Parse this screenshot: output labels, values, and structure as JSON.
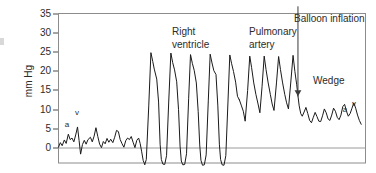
{
  "chart_data": {
    "type": "line",
    "title": "",
    "xlabel": "",
    "ylabel": "mm Hg",
    "ylim": [
      -5,
      36
    ],
    "xlim": [
      0,
      100
    ],
    "grid": false,
    "legend_position": "none",
    "y_ticks": [
      0,
      5,
      10,
      15,
      20,
      25,
      30,
      35
    ],
    "y_tick_labels": [
      "0",
      "5",
      "10",
      "15",
      "20",
      "25",
      "30",
      "35"
    ],
    "zero_reference_line": 0,
    "annotations": [
      {
        "id": "right-ventricle",
        "text": "Right ventricle",
        "lines": [
          "Right",
          "ventricle"
        ],
        "x": 36.5,
        "y": 34.5
      },
      {
        "id": "pulmonary-artery",
        "text": "Pulmonary artery",
        "lines": [
          "Pulmonary",
          "artery"
        ],
        "x": 62.0,
        "y": 34.5
      },
      {
        "id": "balloon-inflation",
        "text": "Balloon inflation",
        "lines": [
          "Balloon inflation"
        ],
        "x": 77.5,
        "y": 40.0
      },
      {
        "id": "wedge",
        "text": "Wedge",
        "lines": [
          "Wedge"
        ],
        "x": 81.5,
        "y": 18.0
      },
      {
        "id": "ra-a-wave",
        "text": "a",
        "x": 2.9,
        "y": 7.0
      },
      {
        "id": "ra-v-wave",
        "text": "v",
        "x": 6.4,
        "y": 10.5
      },
      {
        "id": "pcwp-a-wave",
        "text": "a",
        "x": 93.2,
        "y": 15.0
      },
      {
        "id": "pcwp-v-wave",
        "text": "v",
        "x": 96.3,
        "y": 17.0
      }
    ],
    "arrow": {
      "id": "balloon-inflation-arrow",
      "x": 78.0,
      "y_start": 37.0,
      "y_end": 13.5
    },
    "series": [
      {
        "name": "Pressure tracing",
        "color": "#1a1a1a",
        "segments": [
          {
            "name": "right-atrium",
            "points": [
              [
                0.0,
                0.2
              ],
              [
                0.6,
                1.4
              ],
              [
                1.2,
                0.6
              ],
              [
                1.9,
                2.1
              ],
              [
                2.5,
                1.2
              ],
              [
                3.2,
                3.6
              ],
              [
                3.8,
                2.2
              ],
              [
                4.4,
                2.6
              ],
              [
                5.0,
                1.6
              ],
              [
                5.6,
                3.4
              ],
              [
                6.2,
                5.5
              ],
              [
                6.7,
                2.0
              ],
              [
                7.2,
                -1.6
              ],
              [
                7.8,
                0.9
              ],
              [
                8.4,
                2.0
              ],
              [
                9.0,
                1.0
              ],
              [
                9.6,
                2.2
              ],
              [
                10.4,
                2.8
              ],
              [
                11.0,
                1.6
              ],
              [
                11.6,
                3.1
              ],
              [
                12.2,
                5.3
              ],
              [
                12.8,
                3.0
              ],
              [
                13.4,
                1.0
              ],
              [
                14.0,
                0.1
              ],
              [
                14.6,
                1.7
              ],
              [
                15.2,
                1.1
              ],
              [
                15.8,
                2.5
              ],
              [
                16.4,
                1.5
              ],
              [
                17.0,
                2.3
              ],
              [
                17.7,
                1.4
              ],
              [
                18.3,
                2.8
              ],
              [
                18.9,
                4.6
              ],
              [
                19.5,
                4.3
              ],
              [
                20.1,
                2.2
              ],
              [
                20.7,
                1.1
              ],
              [
                21.3,
                0.2
              ],
              [
                21.9,
                1.9
              ],
              [
                22.5,
                2.6
              ],
              [
                23.1,
                2.2
              ],
              [
                23.7,
                3.0
              ],
              [
                24.3,
                1.5
              ],
              [
                24.9,
                0.1
              ],
              [
                25.5,
                2.0
              ],
              [
                26.1,
                2.6
              ],
              [
                26.6,
                1.2
              ],
              [
                27.1,
                -1.0
              ],
              [
                27.6,
                -3.3
              ],
              [
                28.1,
                -4.3
              ]
            ]
          },
          {
            "name": "right-ventricle",
            "points": [
              [
                28.1,
                -4.3
              ],
              [
                28.6,
                -3.0
              ],
              [
                29.4,
                11.0
              ],
              [
                30.1,
                24.9
              ],
              [
                30.7,
                22.6
              ],
              [
                31.2,
                20.6
              ],
              [
                32.0,
                18.0
              ],
              [
                32.6,
                12.0
              ],
              [
                33.1,
                1.0
              ],
              [
                33.5,
                -3.0
              ],
              [
                34.0,
                -4.2
              ],
              [
                34.6,
                -4.3
              ],
              [
                35.2,
                -2.0
              ],
              [
                35.9,
                12.0
              ],
              [
                36.6,
                24.8
              ],
              [
                37.2,
                22.3
              ],
              [
                37.8,
                20.4
              ],
              [
                38.5,
                17.3
              ],
              [
                39.1,
                10.0
              ],
              [
                39.6,
                0.5
              ],
              [
                40.0,
                -3.4
              ],
              [
                40.5,
                -4.4
              ],
              [
                41.1,
                -4.3
              ],
              [
                41.7,
                -1.5
              ],
              [
                42.4,
                13.0
              ],
              [
                43.0,
                24.4
              ],
              [
                43.6,
                22.1
              ],
              [
                44.2,
                20.3
              ],
              [
                44.9,
                17.0
              ],
              [
                45.5,
                9.5
              ],
              [
                46.0,
                0.8
              ],
              [
                46.4,
                -3.2
              ],
              [
                46.9,
                -4.5
              ],
              [
                47.5,
                -4.4
              ],
              [
                48.1,
                -1.8
              ],
              [
                48.8,
                12.5
              ],
              [
                49.4,
                24.5
              ],
              [
                50.0,
                22.2
              ],
              [
                50.6,
                20.2
              ],
              [
                51.3,
                19.2
              ],
              [
                51.9,
                11.0
              ],
              [
                52.4,
                1.0
              ],
              [
                52.8,
                -3.0
              ],
              [
                53.3,
                -4.4
              ],
              [
                53.9,
                -4.5
              ],
              [
                54.5,
                -2.0
              ],
              [
                55.2,
                12.0
              ],
              [
                55.8,
                24.3
              ],
              [
                56.4,
                22.0
              ],
              [
                57.0,
                20.0
              ],
              [
                57.7,
                17.2
              ],
              [
                58.3,
                13.5
              ],
              [
                58.9,
                12.6
              ]
            ]
          },
          {
            "name": "pulmonary-artery",
            "points": [
              [
                58.9,
                12.6
              ],
              [
                59.6,
                11.0
              ],
              [
                60.2,
                9.6
              ],
              [
                60.8,
                7.0
              ],
              [
                61.6,
                15.0
              ],
              [
                62.3,
                24.0
              ],
              [
                62.9,
                21.0
              ],
              [
                63.6,
                17.0
              ],
              [
                64.3,
                14.0
              ],
              [
                65.0,
                11.5
              ],
              [
                65.6,
                9.2
              ],
              [
                66.3,
                16.0
              ],
              [
                67.0,
                24.0
              ],
              [
                67.6,
                20.5
              ],
              [
                68.3,
                17.0
              ],
              [
                69.0,
                14.0
              ],
              [
                69.6,
                11.5
              ],
              [
                70.2,
                9.8
              ],
              [
                71.0,
                17.0
              ],
              [
                71.7,
                23.9
              ],
              [
                72.3,
                20.5
              ],
              [
                73.0,
                17.0
              ],
              [
                73.7,
                14.0
              ],
              [
                74.3,
                11.8
              ],
              [
                74.9,
                10.2
              ],
              [
                75.7,
                17.5
              ],
              [
                76.4,
                24.2
              ],
              [
                77.0,
                20.0
              ],
              [
                77.6,
                16.5
              ],
              [
                78.0,
                13.6
              ]
            ]
          },
          {
            "name": "wedge",
            "points": [
              [
                78.0,
                13.6
              ],
              [
                78.4,
                11.0
              ],
              [
                78.9,
                9.0
              ],
              [
                79.4,
                8.3
              ],
              [
                80.0,
                9.4
              ],
              [
                80.6,
                10.6
              ],
              [
                81.2,
                9.0
              ],
              [
                81.8,
                7.2
              ],
              [
                82.4,
                6.6
              ],
              [
                83.0,
                8.0
              ],
              [
                83.6,
                9.3
              ],
              [
                84.2,
                8.2
              ],
              [
                84.8,
                7.0
              ],
              [
                85.4,
                6.9
              ],
              [
                86.0,
                8.4
              ],
              [
                86.6,
                10.2
              ],
              [
                87.2,
                9.2
              ],
              [
                87.8,
                7.6
              ],
              [
                88.4,
                7.2
              ],
              [
                89.0,
                8.6
              ],
              [
                89.6,
                10.4
              ],
              [
                90.2,
                9.6
              ],
              [
                90.8,
                8.0
              ],
              [
                91.4,
                7.4
              ],
              [
                92.0,
                8.6
              ],
              [
                92.6,
                10.8
              ],
              [
                93.2,
                11.4
              ],
              [
                93.8,
                9.6
              ],
              [
                94.4,
                8.3
              ],
              [
                95.0,
                9.0
              ],
              [
                95.6,
                10.4
              ],
              [
                96.2,
                11.8
              ],
              [
                96.8,
                10.4
              ],
              [
                97.4,
                8.6
              ],
              [
                98.0,
                7.2
              ],
              [
                98.6,
                6.2
              ]
            ]
          }
        ]
      }
    ]
  }
}
